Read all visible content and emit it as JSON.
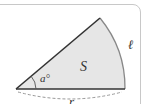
{
  "diagram": {
    "type": "circular-sector",
    "labels": {
      "angle": "a°",
      "area": "S",
      "arc_length": "ℓ",
      "radius": "r"
    },
    "colors": {
      "fill": "#e6e6e6",
      "stroke": "#333333",
      "arc": "#888888",
      "frame": "#c8c8c8",
      "dashed": "#999999"
    }
  }
}
